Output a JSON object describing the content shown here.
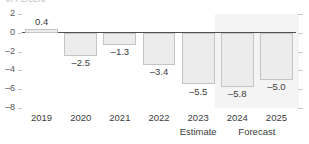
{
  "units_caption": "in Percent",
  "chart_data": {
    "type": "bar",
    "title": "",
    "subtitle": "",
    "xlabel": "",
    "ylabel": "in Percent",
    "categories": [
      "2019",
      "2020",
      "2021",
      "2022",
      "2023",
      "2024",
      "2025"
    ],
    "values": [
      0.4,
      -2.5,
      -1.3,
      -3.4,
      -5.5,
      -5.8,
      -5.0
    ],
    "data_labels": [
      "0.4",
      "-2.5",
      "-1.3",
      "-3.4",
      "-5.5",
      "-5.8",
      "-5.0"
    ],
    "ylim": [
      -8,
      2
    ],
    "yticks": [
      2,
      0,
      -2,
      -4,
      -6,
      -8
    ],
    "ytick_labels": [
      "2",
      "0",
      "-2",
      "-4",
      "-6",
      "-8"
    ],
    "grid": false,
    "legend": "none",
    "annotations": [
      {
        "text": "Estimate",
        "categories": [
          "2023"
        ]
      },
      {
        "text": "Forecast",
        "categories": [
          "2024",
          "2025"
        ]
      }
    ],
    "shaded_region": {
      "label": "Forecast",
      "from_category": "2024",
      "to_category": "2025",
      "color": "#f4f4f4"
    },
    "colors": {
      "bar_fill": "#ececec",
      "bar_border": "#c4c4c4",
      "zero_line": "#4f5054",
      "text": "#3b3c40",
      "axis_text": "#55565a",
      "tick": "#c7c7c7",
      "band": "#f4f4f4"
    }
  }
}
